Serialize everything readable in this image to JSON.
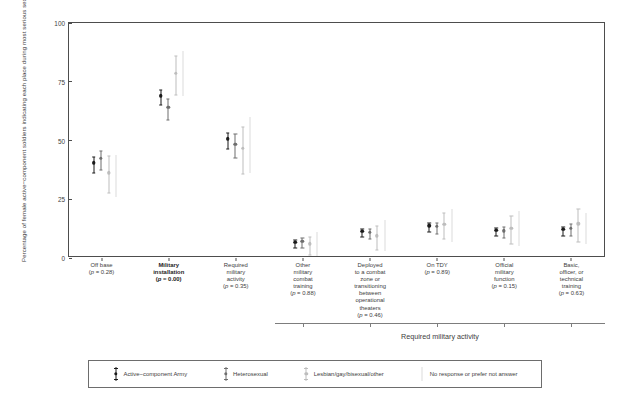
{
  "chart_data": {
    "type": "scatter",
    "title": "",
    "xlabel": "",
    "ylabel": "Percentage of female active−component soldiers indicating each place during most serious sexual assault experience",
    "ylim": [
      0,
      100
    ],
    "yticks": [
      "0",
      "25",
      "50",
      "75",
      "100"
    ],
    "grid": false,
    "legend_position": "bottom",
    "group_bracket_label": "Required military activity",
    "categories": [
      {
        "label_lines": [
          "Off base"
        ],
        "pvalue": "(p = 0.28)",
        "bold": false
      },
      {
        "label_lines": [
          "Military",
          "installation"
        ],
        "pvalue": "(p = 0.00)",
        "bold": true
      },
      {
        "label_lines": [
          "Required",
          "military",
          "activity"
        ],
        "pvalue": "(p = 0.35)",
        "bold": false
      },
      {
        "label_lines": [
          "Other",
          "military",
          "combat",
          "training"
        ],
        "pvalue": "(p = 0.88)",
        "bold": false
      },
      {
        "label_lines": [
          "Deployed",
          "to a combat",
          "zone or",
          "transitioning",
          "between",
          "operational",
          "theaters"
        ],
        "pvalue": "(p = 0.46)",
        "bold": false
      },
      {
        "label_lines": [
          "On TDY"
        ],
        "pvalue": "(p = 0.89)",
        "bold": false
      },
      {
        "label_lines": [
          "Official",
          "military",
          "function"
        ],
        "pvalue": "(p = 0.15)",
        "bold": false
      },
      {
        "label_lines": [
          "Basic,",
          "officer, or",
          "technical",
          "training"
        ],
        "pvalue": "(p = 0.63)",
        "bold": false
      }
    ],
    "series": [
      {
        "name": "Active−component Army",
        "color": "#1a1a1a",
        "marker": "point-with-caps",
        "values": [
          39.6,
          68.2,
          49.8,
          5.8,
          10.6,
          12.8,
          11.0,
          11.4
        ],
        "ci_low": [
          36.2,
          65.1,
          46.4,
          4.2,
          8.9,
          11.0,
          9.3,
          9.5
        ],
        "ci_high": [
          43.0,
          71.3,
          53.2,
          7.6,
          12.4,
          14.7,
          12.8,
          13.3
        ]
      },
      {
        "name": "Heterosexual",
        "color": "#6e6e6e",
        "marker": "point-with-caps",
        "values": [
          41.6,
          63.2,
          47.6,
          6.2,
          10.2,
          12.6,
          10.8,
          11.8
        ],
        "ci_low": [
          37.6,
          58.8,
          42.6,
          4.2,
          8.0,
          10.2,
          8.6,
          9.4
        ],
        "ci_high": [
          45.6,
          67.6,
          52.6,
          8.4,
          12.5,
          15.1,
          13.1,
          14.3
        ]
      },
      {
        "name": "Lesbian/gay/bisexual/other",
        "color": "#bdbdbd",
        "marker": "point-with-caps",
        "values": [
          35.4,
          77.8,
          45.8,
          5.2,
          8.6,
          13.6,
          11.8,
          13.8
        ],
        "ci_low": [
          27.6,
          69.5,
          35.8,
          1.4,
          3.6,
          8.0,
          5.8,
          6.8
        ],
        "ci_high": [
          43.2,
          86.1,
          55.8,
          9.1,
          13.6,
          19.3,
          17.8,
          20.9
        ]
      },
      {
        "name": "No response or prefer not answer",
        "color": "#dcdcdc",
        "marker": "interval-only",
        "values": [
          null,
          null,
          null,
          null,
          null,
          null,
          null,
          null
        ],
        "ci_low": [
          25.8,
          69.0,
          36.0,
          1.0,
          3.0,
          7.0,
          5.0,
          6.0
        ],
        "ci_high": [
          44.0,
          88.0,
          60.0,
          11.0,
          16.0,
          21.0,
          20.0,
          19.0
        ]
      }
    ]
  },
  "legend": {
    "items": [
      {
        "label": "Active−component Army",
        "color": "#1a1a1a",
        "has_point": true
      },
      {
        "label": "Heterosexual",
        "color": "#6e6e6e",
        "has_point": true
      },
      {
        "label": "Lesbian/gay/bisexual/other",
        "color": "#bdbdbd",
        "has_point": true
      },
      {
        "label": "No response or prefer not answer",
        "color": "#dcdcdc",
        "has_point": false
      }
    ]
  }
}
